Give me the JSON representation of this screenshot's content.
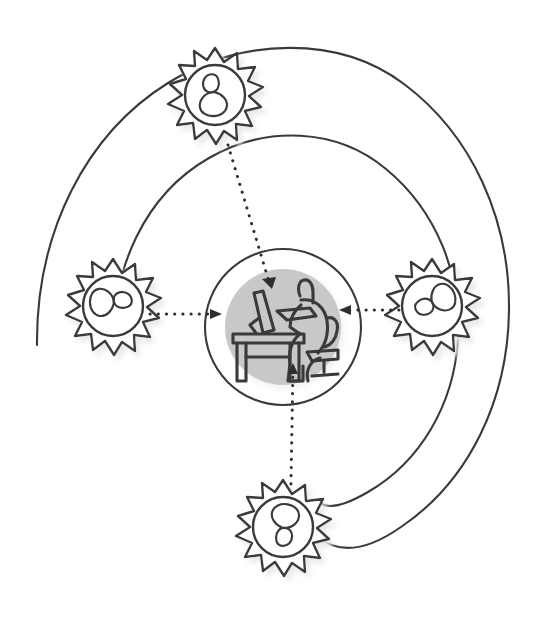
{
  "diagram": {
    "type": "concentric-spiral-hub-and-spoke",
    "background_color": "#ffffff",
    "stroke_color": "#3a3a3a",
    "fill_gray_color": "#c8c8c8",
    "shadow_color": "#d6d6d6",
    "style": "hand-drawn sketch outline"
  },
  "center": {
    "label": "person-at-desk",
    "icon": "worker-at-computer-desk-icon",
    "description": "Seated person working at a desk with a monitor",
    "cx": 283,
    "cy": 327,
    "disc_radius": 58,
    "ring_radius": 78,
    "disc_color": "#c8c8c8",
    "ring_stroke": "#3a3a3a"
  },
  "orbits": {
    "count": 2,
    "description": "Open spiral winding outward clockwise, drawn as two visible turns",
    "stroke": "#3a3a3a",
    "stroke_width": 2.1,
    "inner_turn_radius": 150,
    "outer_turn_radius": 240
  },
  "badges": [
    {
      "id": "badge-top",
      "position": "top",
      "icon": "person-badge-icon",
      "cx": 215,
      "cy": 95,
      "radius": 46,
      "spikes": 12,
      "icon_rotation": 0
    },
    {
      "id": "badge-left",
      "position": "left",
      "icon": "person-badge-icon",
      "cx": 113,
      "cy": 306,
      "radius": 46,
      "spikes": 12,
      "icon_rotation": 90
    },
    {
      "id": "badge-right",
      "position": "right",
      "icon": "person-badge-icon",
      "cx": 432,
      "cy": 306,
      "radius": 46,
      "spikes": 12,
      "icon_rotation": 250
    },
    {
      "id": "badge-bottom",
      "position": "bottom",
      "icon": "person-badge-icon",
      "cx": 283,
      "cy": 527,
      "radius": 46,
      "spikes": 12,
      "icon_rotation": 190
    }
  ],
  "connectors": [
    {
      "id": "arrow-top-to-center",
      "from": "badge-top",
      "to": "center",
      "style": "dotted",
      "direction": "inward",
      "x1": 228,
      "y1": 145,
      "x2": 272,
      "y2": 287
    },
    {
      "id": "arrow-left-to-center",
      "from": "badge-left",
      "to": "center",
      "style": "dotted",
      "direction": "inward",
      "x1": 150,
      "y1": 314,
      "x2": 219,
      "y2": 314
    },
    {
      "id": "arrow-right-to-center",
      "from": "badge-right",
      "to": "center",
      "style": "dotted",
      "direction": "inward",
      "x1": 399,
      "y1": 310,
      "x2": 342,
      "y2": 310
    },
    {
      "id": "arrow-bottom-to-center",
      "from": "badge-bottom",
      "to": "center",
      "style": "dotted",
      "direction": "inward",
      "x1": 291,
      "y1": 484,
      "x2": 293,
      "y2": 364
    }
  ],
  "accessibility": {
    "alt_text": "Hand-drawn diagram: a person working at a computer desk sits inside a shaded circle at the center, encircled by a spiral. Four starburst badges containing person icons surround the center, each sending a dotted arrow inward."
  }
}
